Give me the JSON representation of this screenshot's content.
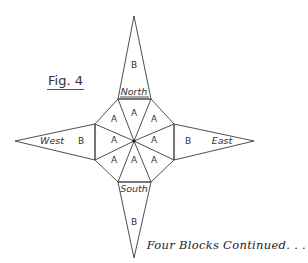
{
  "figure": {
    "title": "Fig. 4",
    "caption": "Four Blocks Continued. . .",
    "center_piece_label": "A",
    "point_piece_label": "B",
    "directions": {
      "north": "North",
      "south": "South",
      "east": "East",
      "west": "West"
    },
    "a_pieces": [
      "A",
      "A",
      "A",
      "A",
      "A",
      "A",
      "A",
      "A"
    ],
    "b_pieces": [
      "B",
      "B",
      "B",
      "B"
    ],
    "colors": {
      "line": "#3a3a3a",
      "text": "#333333",
      "background": "#ffffff"
    }
  }
}
